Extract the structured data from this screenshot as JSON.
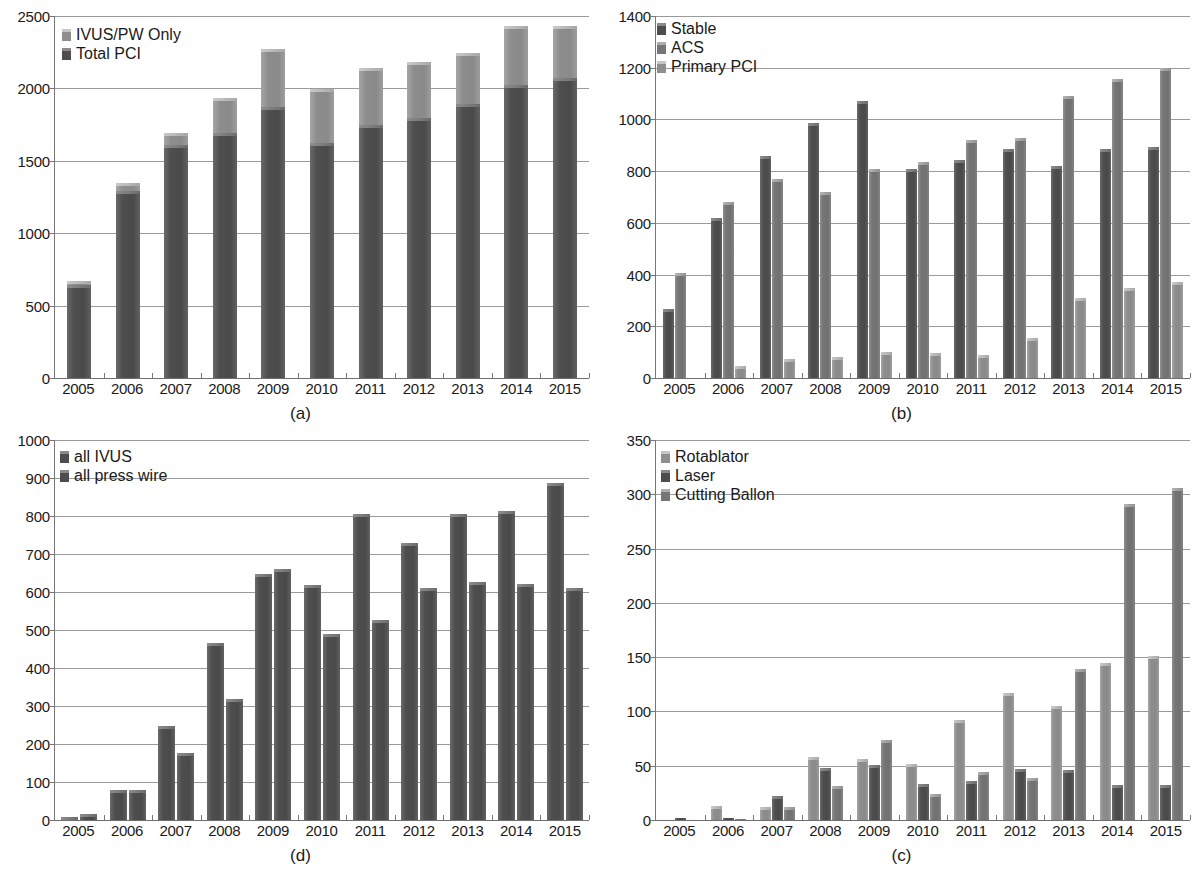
{
  "figure": {
    "panels": [
      "a",
      "b",
      "d",
      "c"
    ]
  },
  "panel_a": {
    "caption": "(a)",
    "legend": [
      {
        "label": "IVUS/PW Only",
        "swatch": "sw-light"
      },
      {
        "label": "Total PCI",
        "swatch": "sw-dark"
      }
    ],
    "chart_data": {
      "type": "bar",
      "subtype": "stacked",
      "title": "",
      "xlabel": "",
      "ylabel": "",
      "ylim": [
        0,
        2500
      ],
      "yticks": [
        0,
        500,
        1000,
        1500,
        2000,
        2500
      ],
      "grid": true,
      "legend_position": "top-left",
      "categories": [
        "2005",
        "2006",
        "2007",
        "2008",
        "2009",
        "2010",
        "2011",
        "2012",
        "2013",
        "2014",
        "2015"
      ],
      "series": [
        {
          "name": "Total PCI",
          "values": [
            640,
            1290,
            1610,
            1690,
            1870,
            1625,
            1750,
            1795,
            1890,
            2025,
            2075
          ]
        },
        {
          "name": "IVUS/PW Only",
          "values": [
            30,
            55,
            80,
            245,
            400,
            370,
            390,
            390,
            355,
            405,
            355
          ]
        }
      ],
      "totals": [
        670,
        1345,
        1690,
        1935,
        2270,
        1995,
        2140,
        2185,
        2245,
        2430,
        2430
      ]
    }
  },
  "panel_b": {
    "caption": "(b)",
    "legend": [
      {
        "label": "Stable",
        "swatch": "sw-dark"
      },
      {
        "label": "ACS",
        "swatch": "sw-mid"
      },
      {
        "label": "Primary PCI",
        "swatch": "sw-light"
      }
    ],
    "chart_data": {
      "type": "bar",
      "subtype": "grouped",
      "title": "",
      "xlabel": "",
      "ylabel": "",
      "ylim": [
        0,
        1400
      ],
      "yticks": [
        0,
        200,
        400,
        600,
        800,
        1000,
        1200,
        1400
      ],
      "grid": true,
      "legend_position": "top-left",
      "categories": [
        "2005",
        "2006",
        "2007",
        "2008",
        "2009",
        "2010",
        "2011",
        "2012",
        "2013",
        "2014",
        "2015"
      ],
      "series": [
        {
          "name": "Stable",
          "values": [
            265,
            620,
            860,
            985,
            1070,
            810,
            845,
            885,
            820,
            885,
            895
          ]
        },
        {
          "name": "ACS",
          "values": [
            405,
            680,
            770,
            720,
            810,
            835,
            920,
            930,
            1090,
            1155,
            1200
          ]
        },
        {
          "name": "Primary PCI",
          "values": [
            0,
            45,
            75,
            80,
            100,
            98,
            88,
            155,
            310,
            348,
            370
          ]
        }
      ]
    }
  },
  "panel_d": {
    "caption": "(d)",
    "legend": [
      {
        "label": "all IVUS",
        "swatch": "sw-dark"
      },
      {
        "label": "all press wire",
        "swatch": "sw-dark"
      }
    ],
    "chart_data": {
      "type": "bar",
      "subtype": "grouped",
      "title": "",
      "xlabel": "",
      "ylabel": "",
      "ylim": [
        0,
        1000
      ],
      "yticks": [
        0,
        100,
        200,
        300,
        400,
        500,
        600,
        700,
        800,
        900,
        1000
      ],
      "grid": true,
      "legend_position": "top-left",
      "categories": [
        "2005",
        "2006",
        "2007",
        "2008",
        "2009",
        "2010",
        "2011",
        "2012",
        "2013",
        "2014",
        "2015"
      ],
      "series": [
        {
          "name": "all IVUS",
          "values": [
            8,
            78,
            248,
            465,
            648,
            618,
            805,
            728,
            805,
            812,
            888
          ]
        },
        {
          "name": "all press wire",
          "values": [
            15,
            80,
            176,
            318,
            660,
            490,
            527,
            610,
            627,
            622,
            610
          ]
        }
      ]
    }
  },
  "panel_c": {
    "caption": "(c)",
    "legend": [
      {
        "label": "Rotablator",
        "swatch": "sw-light"
      },
      {
        "label": "Laser",
        "swatch": "sw-dark"
      },
      {
        "label": "Cutting Ballon",
        "swatch": "sw-mid"
      }
    ],
    "chart_data": {
      "type": "bar",
      "subtype": "grouped",
      "title": "",
      "xlabel": "",
      "ylabel": "",
      "ylim": [
        0,
        350
      ],
      "yticks": [
        0,
        50,
        100,
        150,
        200,
        250,
        300,
        350
      ],
      "grid": true,
      "legend_position": "top-left",
      "categories": [
        "2005",
        "2006",
        "2007",
        "2008",
        "2009",
        "2010",
        "2011",
        "2012",
        "2013",
        "2014",
        "2015"
      ],
      "series": [
        {
          "name": "Rotablator",
          "values": [
            0,
            13,
            12,
            58,
            56,
            52,
            92,
            117,
            105,
            145,
            151
          ]
        },
        {
          "name": "Laser",
          "values": [
            2,
            2,
            22,
            48,
            51,
            33,
            36,
            47,
            46,
            32,
            32
          ]
        },
        {
          "name": "Cutting Ballon",
          "values": [
            0,
            1,
            12,
            31,
            74,
            24,
            44,
            39,
            139,
            291,
            306
          ]
        }
      ]
    }
  }
}
